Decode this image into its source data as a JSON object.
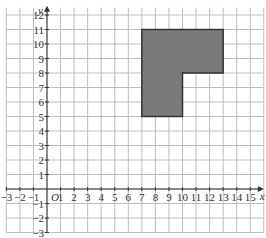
{
  "diagram": {
    "type": "coordinate-grid",
    "x_axis": {
      "label": "x",
      "min": -3,
      "max": 16,
      "ticks": [
        -3,
        -2,
        -1,
        1,
        2,
        3,
        4,
        5,
        6,
        7,
        8,
        9,
        10,
        11,
        12,
        13,
        14,
        15
      ]
    },
    "y_axis": {
      "label": "y",
      "min": -3,
      "max": 12.5,
      "ticks": [
        12,
        11,
        10,
        9,
        8,
        7,
        6,
        5,
        4,
        3,
        2,
        1,
        -1,
        -2,
        -3
      ]
    },
    "origin_label": "O",
    "shape": {
      "name": "L-shape",
      "fill": "#7a7a7a",
      "stroke": "#333333",
      "vertices": [
        [
          7,
          5
        ],
        [
          7,
          11
        ],
        [
          13,
          11
        ],
        [
          13,
          8
        ],
        [
          10,
          8
        ],
        [
          10,
          5
        ]
      ]
    }
  }
}
